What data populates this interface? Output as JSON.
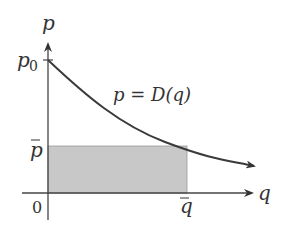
{
  "diagram": {
    "type": "demand-curve-revenue",
    "y_axis_label": "p",
    "x_axis_label": "q",
    "origin_label": "0",
    "p0_label": "p",
    "p0_subscript": "0",
    "pbar_label": "p",
    "qbar_label": "q",
    "curve_label": "p = D(q)",
    "colors": {
      "axis": "#444444",
      "curve": "#3a3a3a",
      "shaded_region": "#c8c8c8",
      "shaded_border": "#999999",
      "text": "#333333"
    }
  }
}
